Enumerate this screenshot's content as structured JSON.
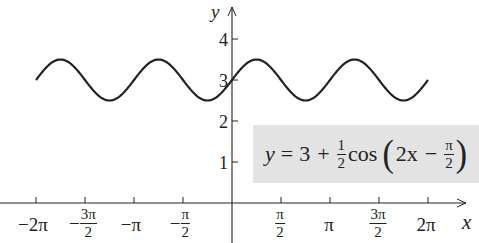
{
  "chart_data": {
    "type": "line",
    "title": "",
    "equation": {
      "lhs": "y",
      "eq": "=",
      "const": "3",
      "plus": "+",
      "coef_num": "1",
      "coef_den": "2",
      "func": "cos",
      "arg_main": "2x",
      "arg_minus": "−",
      "arg_frac_num": "π",
      "arg_frac_den": "2",
      "text": "y = 3 + (1/2)cos(2x − π/2)"
    },
    "xlabel": "x",
    "ylabel": "y",
    "xlim": [
      -6.9,
      7.3
    ],
    "ylim": [
      0,
      4.5
    ],
    "x_ticks": [
      {
        "value": -6.2832,
        "label": "−2π"
      },
      {
        "value": -4.7124,
        "label": "−3π/2",
        "num": "3π",
        "den": "2",
        "sign": "−"
      },
      {
        "value": -3.1416,
        "label": "−π"
      },
      {
        "value": -1.5708,
        "label": "−π/2",
        "num": "π",
        "den": "2",
        "sign": "−"
      },
      {
        "value": 1.5708,
        "label": "π/2",
        "num": "π",
        "den": "2"
      },
      {
        "value": 3.1416,
        "label": "π"
      },
      {
        "value": 4.7124,
        "label": "3π/2",
        "num": "3π",
        "den": "2"
      },
      {
        "value": 6.2832,
        "label": "2π"
      }
    ],
    "y_ticks": [
      {
        "value": 1,
        "label": "1"
      },
      {
        "value": 2,
        "label": "2"
      },
      {
        "value": 3,
        "label": "3"
      },
      {
        "value": 4,
        "label": "4"
      }
    ],
    "series": [
      {
        "name": "y = 3 + (1/2)cos(2x − π/2)",
        "x_range": [
          -6.2832,
          6.2832
        ],
        "amplitude": 0.5,
        "period": 3.1416,
        "midline": 3,
        "phase_shift": 0.7854,
        "max": 3.5,
        "min": 2.5,
        "color": "#222222"
      }
    ],
    "grid": false,
    "legend": "boxed equation label at lower right",
    "box_color": "#e3e3e3"
  },
  "labels": {
    "x_axis": "x",
    "y_axis": "y",
    "xt": {
      "neg2pi": "−2π",
      "neg3pi2_sign": "−",
      "neg3pi2_num": "3π",
      "neg3pi2_den": "2",
      "negpi": "−π",
      "negpi2_sign": "−",
      "negpi2_num": "π",
      "negpi2_den": "2",
      "pi2_num": "π",
      "pi2_den": "2",
      "pi": "π",
      "threepi2_num": "3π",
      "threepi2_den": "2",
      "twopi": "2π"
    },
    "yt": {
      "one": "1",
      "two": "2",
      "three": "3",
      "four": "4"
    }
  }
}
